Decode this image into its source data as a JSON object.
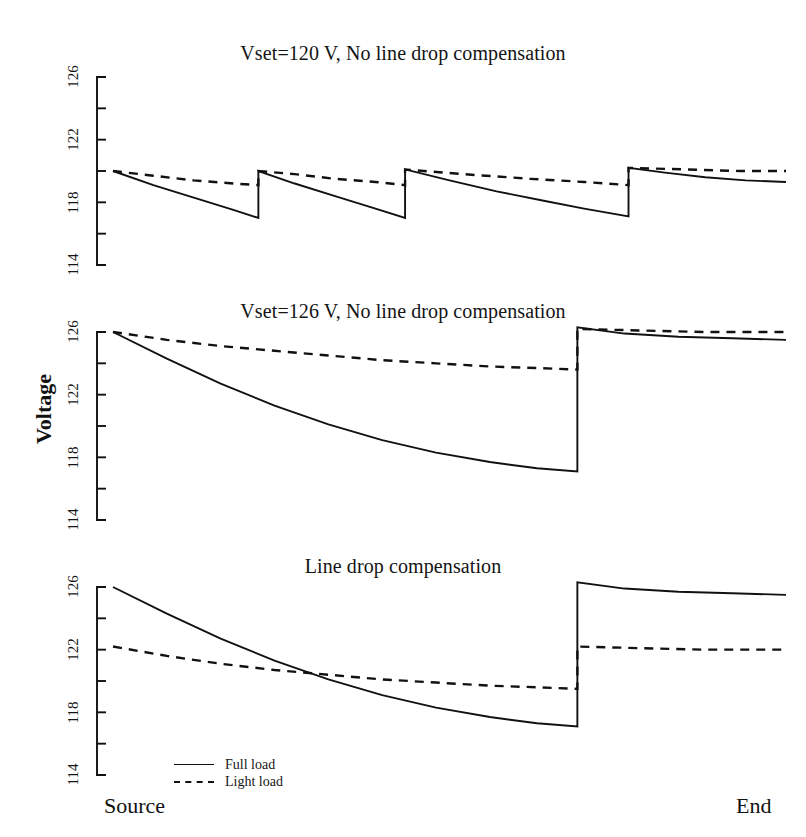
{
  "figure": {
    "yaxis_title": "Voltage",
    "xlabel_left": "Source",
    "xlabel_right": "End"
  },
  "legend": {
    "items": [
      {
        "label": "Full load",
        "style": "solid"
      },
      {
        "label": "Light load",
        "style": "dashed"
      }
    ]
  },
  "panels": [
    {
      "title": "Vset=120 V, No line drop compensation"
    },
    {
      "title": "Vset=126 V, No line drop compensation"
    },
    {
      "title": "Line drop compensation"
    }
  ],
  "chart_data": [
    {
      "type": "line",
      "title": "Vset=120 V, No line drop compensation",
      "xlabel": "",
      "ylabel": "Voltage",
      "xlim": [
        0,
        1
      ],
      "ylim": [
        114,
        126
      ],
      "yticks": [
        114,
        116,
        118,
        120,
        122,
        124,
        126
      ],
      "ytick_labels": [
        "114",
        "",
        "118",
        "",
        "122",
        "",
        "126"
      ],
      "xtick_labels": [
        "Source",
        "End"
      ],
      "grid": false,
      "legend_position": "bottom-left",
      "series": [
        {
          "name": "Full load",
          "style": "solid",
          "x": [
            0.0,
            0.06,
            0.12,
            0.18,
            0.216,
            0.216,
            0.27,
            0.33,
            0.39,
            0.434,
            0.434,
            0.5,
            0.57,
            0.64,
            0.7,
            0.766,
            0.766,
            0.82,
            0.88,
            0.94,
            1.0
          ],
          "y": [
            120.0,
            119.1,
            118.3,
            117.5,
            117.0,
            120.0,
            119.2,
            118.4,
            117.6,
            117.0,
            120.1,
            119.4,
            118.7,
            118.1,
            117.6,
            117.1,
            120.2,
            119.9,
            119.6,
            119.4,
            119.3
          ]
        },
        {
          "name": "Light load",
          "style": "dashed",
          "x": [
            0.0,
            0.06,
            0.12,
            0.18,
            0.216,
            0.216,
            0.27,
            0.33,
            0.39,
            0.434,
            0.434,
            0.52,
            0.62,
            0.7,
            0.766,
            0.766,
            0.85,
            0.93,
            1.0
          ],
          "y": [
            120.0,
            119.7,
            119.4,
            119.2,
            119.1,
            120.0,
            119.8,
            119.5,
            119.3,
            119.1,
            120.1,
            119.8,
            119.5,
            119.3,
            119.1,
            120.2,
            120.1,
            120.0,
            120.0
          ]
        }
      ]
    },
    {
      "type": "line",
      "title": "Vset=126 V, No line drop compensation",
      "xlabel": "",
      "ylabel": "Voltage",
      "xlim": [
        0,
        1
      ],
      "ylim": [
        114,
        126
      ],
      "yticks": [
        114,
        116,
        118,
        120,
        122,
        124,
        126
      ],
      "ytick_labels": [
        "114",
        "",
        "118",
        "",
        "122",
        "",
        "126"
      ],
      "xtick_labels": [
        "Source",
        "End"
      ],
      "grid": false,
      "series": [
        {
          "name": "Full load",
          "style": "solid",
          "x": [
            0.0,
            0.08,
            0.16,
            0.24,
            0.32,
            0.4,
            0.48,
            0.56,
            0.63,
            0.69,
            0.69,
            0.76,
            0.84,
            0.92,
            1.0
          ],
          "y": [
            126.0,
            124.3,
            122.7,
            121.3,
            120.1,
            119.1,
            118.3,
            117.7,
            117.3,
            117.1,
            126.3,
            125.9,
            125.7,
            125.6,
            125.5
          ]
        },
        {
          "name": "Light load",
          "style": "dashed",
          "x": [
            0.0,
            0.08,
            0.16,
            0.24,
            0.32,
            0.4,
            0.48,
            0.56,
            0.63,
            0.69,
            0.69,
            0.78,
            0.88,
            1.0
          ],
          "y": [
            126.0,
            125.5,
            125.1,
            124.8,
            124.5,
            124.2,
            124.0,
            123.8,
            123.7,
            123.6,
            126.2,
            126.1,
            126.0,
            126.0
          ]
        }
      ]
    },
    {
      "type": "line",
      "title": "Line drop compensation",
      "xlabel": "",
      "ylabel": "Voltage",
      "xlim": [
        0,
        1
      ],
      "ylim": [
        114,
        126
      ],
      "yticks": [
        114,
        116,
        118,
        120,
        122,
        124,
        126
      ],
      "ytick_labels": [
        "114",
        "",
        "118",
        "",
        "122",
        "",
        "126"
      ],
      "xtick_labels": [
        "Source",
        "End"
      ],
      "grid": false,
      "series": [
        {
          "name": "Full load",
          "style": "solid",
          "x": [
            0.0,
            0.08,
            0.16,
            0.24,
            0.32,
            0.4,
            0.48,
            0.56,
            0.63,
            0.69,
            0.69,
            0.76,
            0.84,
            0.92,
            1.0
          ],
          "y": [
            126.0,
            124.3,
            122.7,
            121.3,
            120.1,
            119.1,
            118.3,
            117.7,
            117.3,
            117.1,
            126.3,
            125.9,
            125.7,
            125.6,
            125.5
          ]
        },
        {
          "name": "Light load",
          "style": "dashed",
          "x": [
            0.0,
            0.08,
            0.16,
            0.24,
            0.32,
            0.4,
            0.48,
            0.56,
            0.63,
            0.69,
            0.69,
            0.78,
            0.88,
            1.0
          ],
          "y": [
            122.2,
            121.6,
            121.1,
            120.7,
            120.4,
            120.1,
            119.9,
            119.7,
            119.6,
            119.5,
            122.2,
            122.1,
            122.0,
            122.0
          ]
        }
      ]
    }
  ]
}
